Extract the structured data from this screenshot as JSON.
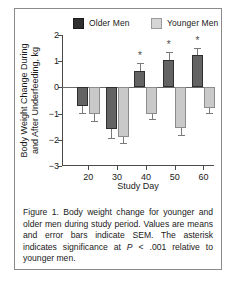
{
  "figure": {
    "caption_lead": "Figure 1.",
    "caption_part1": " Body weight change for younger and older men during study period. Values are means and error bars indicate SEM. The asterisk indicates significance at ",
    "caption_italic_p": "P",
    "caption_part2": " < .001 relative to younger men.",
    "caption_full": "Figure 1. Body weight change for younger and older men during study period. Values are means and error bars indicate SEM. The asterisk indicates significance at P < .001 relative to younger men."
  },
  "chart_data": {
    "type": "bar",
    "title": "",
    "xlabel": "Study Day",
    "ylabel": "Body Weight Change During and After Underfeeding, kg",
    "ylabel_line1": "Body Weight Change During",
    "ylabel_line2": "and After Underfeeding, kg",
    "categories": [
      "20",
      "30",
      "40",
      "50",
      "60"
    ],
    "ylim": [
      -3,
      2
    ],
    "yticks": [
      2,
      1,
      0,
      -1,
      -2,
      -3
    ],
    "ytick_labels": [
      "2",
      "1",
      "0",
      "-1",
      "-2",
      "-3"
    ],
    "xtick_labels": [
      "20",
      "30",
      "40",
      "50",
      "60"
    ],
    "grid": false,
    "legend_position": "top",
    "significance_marker": "*",
    "series": [
      {
        "name": "Older Men",
        "color": "#636363",
        "values": [
          -0.7,
          -1.6,
          0.62,
          1.05,
          1.22
        ],
        "errors": [
          0.28,
          0.32,
          0.3,
          0.3,
          0.3
        ],
        "significant": [
          false,
          false,
          true,
          true,
          true
        ]
      },
      {
        "name": "Younger Men",
        "color": "#c9c9c9",
        "values": [
          -1.02,
          -1.9,
          -1.0,
          -1.55,
          -0.78
        ],
        "errors": [
          0.25,
          0.22,
          0.2,
          0.25,
          0.18
        ],
        "significant": [
          false,
          false,
          false,
          false,
          false
        ]
      }
    ]
  },
  "legend": {
    "older_label": "Older  Men",
    "younger_label": "Younger Men"
  }
}
